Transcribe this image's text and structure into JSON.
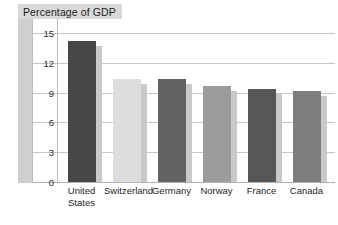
{
  "chart_data": {
    "type": "bar",
    "title": "Percentage of GDP",
    "xlabel": "",
    "ylabel": "",
    "ylim": [
      0,
      16.4
    ],
    "yticks": [
      "0",
      "3",
      "6",
      "9",
      "12",
      "15"
    ],
    "ytick_values": [
      0,
      3,
      6,
      9,
      12,
      15
    ],
    "grid": true,
    "legend": "none",
    "categories": [
      "United\nStates",
      "Switzerland",
      "Germany",
      "Norway",
      "France",
      "Canada"
    ],
    "values": [
      14.2,
      10.4,
      10.4,
      9.7,
      9.4,
      9.2
    ],
    "series": [
      {
        "name": "Percentage of GDP",
        "values": [
          14.2,
          10.4,
          10.4,
          9.7,
          9.4,
          9.2
        ]
      }
    ],
    "bar_colors": [
      "#474747",
      "#dddddd",
      "#636363",
      "#9b9b9b",
      "#575757",
      "#7e7e7e"
    ],
    "bar_shadow_color": "#c9c9c9",
    "plot_background": "#ffffff",
    "gridline_color": "#c6c6c6",
    "title_box_color": "#d9d9d9",
    "left_wall_color": "#cfcfcf"
  },
  "chart": {
    "title": "Percentage of GDP",
    "yticks": [
      {
        "label": "15",
        "value": 15
      },
      {
        "label": "12",
        "value": 12
      },
      {
        "label": "9",
        "value": 9
      },
      {
        "label": "6",
        "value": 6
      },
      {
        "label": "3",
        "value": 3
      },
      {
        "label": "0",
        "value": 0
      }
    ],
    "bars": [
      {
        "label": "United\nStates",
        "value": 14.2,
        "color": "#474747"
      },
      {
        "label": "Switzerland",
        "value": 10.4,
        "color": "#dddddd"
      },
      {
        "label": "Germany",
        "value": 10.4,
        "color": "#636363"
      },
      {
        "label": "Norway",
        "value": 9.7,
        "color": "#9b9b9b"
      },
      {
        "label": "France",
        "value": 9.4,
        "color": "#575757"
      },
      {
        "label": "Canada",
        "value": 9.2,
        "color": "#7e7e7e"
      }
    ]
  }
}
